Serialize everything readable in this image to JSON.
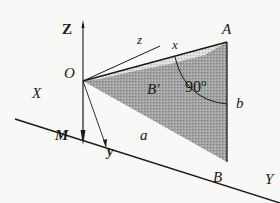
{
  "diagram": {
    "type": "3d-geometry",
    "colors": {
      "ink": "#1a1a1a",
      "shade_dark": "#9a9a9a",
      "shade_light": "#cfcfcf",
      "background": "#f8f8f6"
    },
    "points": {
      "O": {
        "label": "O",
        "x": 83,
        "y": 81
      },
      "A": {
        "label": "A",
        "x": 227,
        "y": 42
      },
      "B": {
        "label": "B",
        "x": 227,
        "y": 162
      },
      "B_prime": {
        "label": "B′",
        "x": 150,
        "y": 85
      }
    },
    "axes": {
      "Z": {
        "label": "Z"
      },
      "X": {
        "label": "X"
      },
      "Y": {
        "label": "Y"
      },
      "M": {
        "label": "M"
      },
      "x": {
        "label": "x"
      },
      "y": {
        "label": "y"
      },
      "z": {
        "label": "z"
      }
    },
    "sides": {
      "a": {
        "label": "a"
      },
      "b": {
        "label": "b"
      }
    },
    "angle": {
      "label": "90",
      "unit": "o"
    }
  }
}
